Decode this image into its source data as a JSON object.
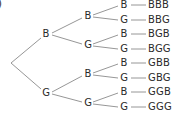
{
  "partial_label": ")",
  "tree": {
    "level1": [
      {
        "label": "B",
        "x": 46,
        "y": 34
      },
      {
        "label": "G",
        "x": 46,
        "y": 93
      }
    ],
    "level2": [
      {
        "label": "B",
        "x": 88,
        "y": 16
      },
      {
        "label": "G",
        "x": 88,
        "y": 45
      },
      {
        "label": "B",
        "x": 88,
        "y": 74
      },
      {
        "label": "G",
        "x": 88,
        "y": 103
      }
    ],
    "level3": [
      {
        "label": "B",
        "x": 124,
        "y": 5
      },
      {
        "label": "G",
        "x": 124,
        "y": 20
      },
      {
        "label": "B",
        "x": 124,
        "y": 34
      },
      {
        "label": "G",
        "x": 124,
        "y": 49
      },
      {
        "label": "B",
        "x": 124,
        "y": 63
      },
      {
        "label": "G",
        "x": 124,
        "y": 78
      },
      {
        "label": "B",
        "x": 124,
        "y": 92
      },
      {
        "label": "G",
        "x": 124,
        "y": 107
      }
    ],
    "outcomes": [
      "BBB",
      "BBG",
      "BGB",
      "BGG",
      "GBB",
      "GBG",
      "GGB",
      "GGG"
    ]
  },
  "colors": {
    "line": "#8a8a8a",
    "text": "#2a2a2a"
  }
}
